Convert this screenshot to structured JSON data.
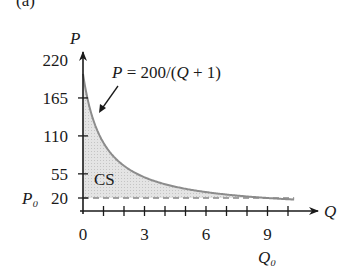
{
  "panel_label": "(a)",
  "chart_data": {
    "type": "area",
    "title": "",
    "xlabel": "Q",
    "ylabel": "P",
    "equation_label": "P = 200/(Q + 1)",
    "region_label": "CS",
    "reference_line": {
      "label": "P₀",
      "value": 20,
      "style": "dashed"
    },
    "x_marker_label": "Q₀",
    "x_marker_value": 9,
    "x_ticks": [
      0,
      1,
      2,
      3,
      4,
      5,
      6,
      7,
      8,
      9,
      10
    ],
    "x_tick_labels": [
      "0",
      "3",
      "6",
      "9"
    ],
    "y_tick_labels": [
      "220",
      "165",
      "110",
      "55",
      "20"
    ],
    "y_ticks": [
      20,
      55,
      110,
      165,
      220
    ],
    "xlim": [
      0,
      11.5
    ],
    "ylim": [
      0,
      240
    ],
    "grid": false,
    "x": [
      0,
      0.5,
      1,
      2,
      3,
      4,
      5,
      6,
      7,
      8,
      9,
      10
    ],
    "series": [
      {
        "name": "P = 200/(Q + 1)",
        "values": [
          200,
          133.3,
          100,
          66.7,
          50,
          40,
          33.3,
          28.6,
          25,
          22.2,
          20,
          18.2
        ]
      }
    ],
    "shaded_region": "between curve and P = 20 from Q = 0 to Q = 9 (consumer surplus)"
  }
}
